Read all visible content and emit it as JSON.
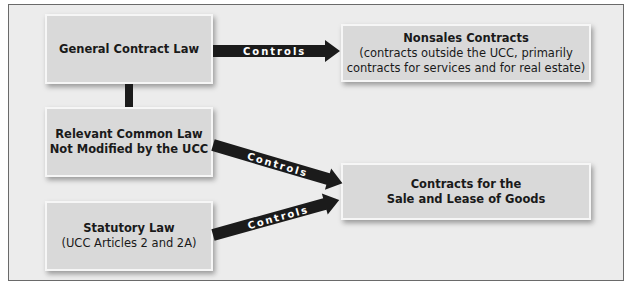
{
  "diagram": {
    "nodes": {
      "general": {
        "title": "General Contract Law"
      },
      "common": {
        "title_line1": "Relevant Common Law",
        "title_line2": "Not Modified by the UCC"
      },
      "statutory": {
        "title": "Statutory Law",
        "subtitle": "(UCC Articles 2 and 2A)"
      },
      "nonsales": {
        "title": "Nonsales Contracts",
        "subtitle_line1": "(contracts outside the UCC, primarily",
        "subtitle_line2": "contracts for services and for real estate)"
      },
      "goods": {
        "title_line1": "Contracts for the",
        "title_line2": "Sale and Lease of Goods"
      }
    },
    "edges": [
      {
        "from": "general",
        "to": "nonsales",
        "label": "Controls"
      },
      {
        "from": "common",
        "to": "goods",
        "label": "Controls"
      },
      {
        "from": "statutory",
        "to": "goods",
        "label": "Controls"
      }
    ],
    "links": [
      {
        "from": "general",
        "to": "common",
        "type": "connector"
      }
    ],
    "colors": {
      "box_fill": "#d9d9d9",
      "background": "#ececec",
      "arrow": "#1b1b1b",
      "label": "#ffffff"
    }
  }
}
